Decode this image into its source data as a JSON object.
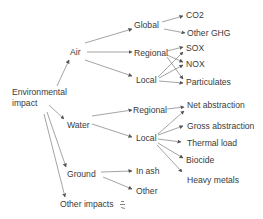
{
  "diagram": {
    "type": "tree",
    "root": {
      "label": "Environmental impact",
      "line1": "Environmental",
      "line2": "impact"
    },
    "categories": {
      "air": {
        "label": "Air",
        "global": {
          "label": "Global",
          "children": [
            "CO2",
            "Other GHG"
          ]
        },
        "regional": {
          "label": "Regional",
          "children": [
            "SOX",
            "NOX",
            "Particulates"
          ]
        },
        "local": {
          "label": "Local",
          "children": [
            "SOX",
            "NOX",
            "Particulates"
          ]
        }
      },
      "water": {
        "label": "Water",
        "regional": {
          "label": "Regional",
          "children": [
            "Net abstraction"
          ]
        },
        "local": {
          "label": "Local",
          "children": [
            "Net abstraction",
            "Gross abstraction",
            "Thermal load",
            "Biocide",
            "Heavy metals"
          ]
        }
      },
      "ground": {
        "label": "Ground",
        "children": [
          "In ash",
          "Other"
        ]
      },
      "other": {
        "label": "Other impacts",
        "icon": "ellipsis-arrows-icon"
      }
    },
    "leaves": {
      "co2": "CO2",
      "other_ghg": "Other GHG",
      "sox": "SOX",
      "nox": "NOX",
      "particulates": "Particulates",
      "net_abstraction": "Net abstraction",
      "gross_abstraction": "Gross abstraction",
      "thermal_load": "Thermal load",
      "biocide": "Biocide",
      "heavy_metals": "Heavy metals",
      "in_ash": "In ash",
      "other": "Other"
    },
    "colors": {
      "text": "#3a3a3a",
      "arrow": "#555555",
      "background": "#ffffff"
    }
  }
}
